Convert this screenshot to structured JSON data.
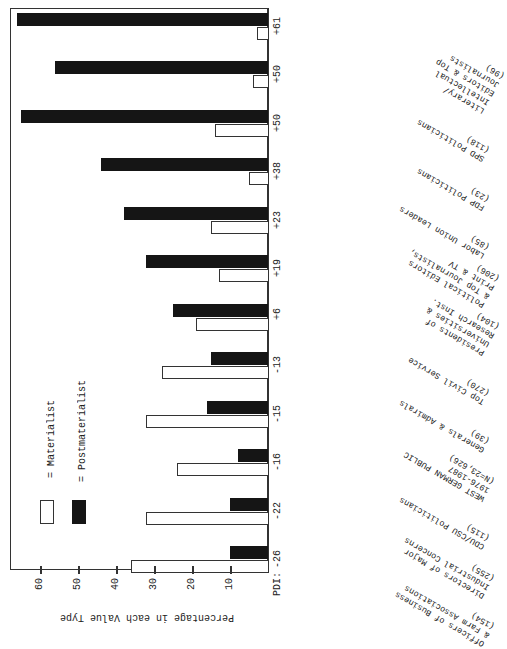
{
  "chart_data": {
    "type": "bar",
    "orientation": "horizontal (image rotated 90°; value axis along bottom)",
    "title": "",
    "ylabel": "Percentage in each Value Type",
    "xlabel": "",
    "ylim": [
      0,
      65
    ],
    "ticks": [
      10,
      20,
      30,
      40,
      50,
      60
    ],
    "grid": false,
    "legend_position": "inside, lower-left",
    "pdi_label": "PDI:",
    "categories": [
      "Officers of Business & Farm Associations (154)",
      "Directors of Major Industrial Concerns (255)",
      "CDU/CSU Politicians (115)",
      "WEST GERMAN PUBLIC 1976-1987 (N=23,626)",
      "Generals & Admirals (39)",
      "Top Civil Service (270)",
      "Presidents of Universities & Research Inst. (104)",
      "Political Editors & Top Journalists, Print & TV (206)",
      "Labor Union Leaders (85)",
      "FDP Politicians (23)",
      "SPD Politicians (118)",
      "Literary/Intellectual Editors & Top Journalists (96)"
    ],
    "pdi": [
      "-26",
      "-22",
      "-16",
      "-15",
      "-13",
      "+6",
      "+19",
      "+23",
      "+38",
      "+50",
      "+50",
      "+61"
    ],
    "series": [
      {
        "name": "Materialist",
        "color": "#ffffff",
        "values": [
          36,
          32,
          24,
          32,
          28,
          19,
          13,
          15,
          5,
          14,
          4,
          3
        ]
      },
      {
        "name": "Postmaterialist",
        "color": "#151515",
        "values": [
          10,
          10,
          8,
          16,
          15,
          25,
          32,
          38,
          44,
          65,
          56,
          66
        ]
      }
    ]
  },
  "axis": {
    "title": "Percentage in each Value Type",
    "ticks": [
      "60",
      "50",
      "40",
      "30",
      "20",
      "10"
    ]
  },
  "legend": {
    "materialist": "= Materialist",
    "postmaterialist": "= Postmaterialist"
  },
  "pdi_head": "PDI:",
  "groups": [
    {
      "pdi": "-26",
      "label": "Officers of Business\n& Farm Associations\n(154)"
    },
    {
      "pdi": "-22",
      "label": "Directors of Major\nIndustrial Concerns\n(255)"
    },
    {
      "pdi": "-16",
      "label": "CDU/CSU Politicians\n(115)"
    },
    {
      "pdi": "-15",
      "label": "WEST GERMAN PUBLIC\n1976-1987\n(N=23,626)"
    },
    {
      "pdi": "-13",
      "label": "Generals & Admirals\n(39)"
    },
    {
      "pdi": "+6",
      "label": "Top Civil Service\n(270)"
    },
    {
      "pdi": "+19",
      "label": "Presidents of\nUniversities &\nResearch Inst.\n(104)"
    },
    {
      "pdi": "+23",
      "label": "Political Editors\n& Top Journalists,\nPrint & TV\n(206)"
    },
    {
      "pdi": "+38",
      "label": "Labor Union Leaders\n(85)"
    },
    {
      "pdi": "+50",
      "label": "FDP Politicians\n(23)"
    },
    {
      "pdi": "+50",
      "label": "SPD Politicians\n(118)"
    },
    {
      "pdi": "+61",
      "label": "Literary/\nIntellectual\nEditors & Top\nJournalists\n(96)"
    }
  ]
}
